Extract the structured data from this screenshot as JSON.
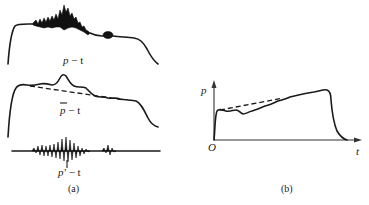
{
  "figure": {
    "panel_a": {
      "caption": "(a)",
      "traces": [
        {
          "id": "p-t",
          "label_base": "p",
          "label_suffix": " − t",
          "overline": false,
          "description": "raw pressure vs time with fluctuations"
        },
        {
          "id": "pbar-t",
          "label_base": "p",
          "label_suffix": " − t",
          "overline": true,
          "description": "mean pressure vs time with dashed baseline"
        },
        {
          "id": "pprime-t",
          "label_base": "p′",
          "label_suffix": "  − t",
          "overline": false,
          "description": "pressure fluctuation vs time"
        }
      ]
    },
    "panel_b": {
      "caption": "(b)",
      "y_axis_label": "p",
      "x_axis_label": "t",
      "origin_label": "O",
      "description": "pressure-time curve with dashed line over dip"
    }
  }
}
